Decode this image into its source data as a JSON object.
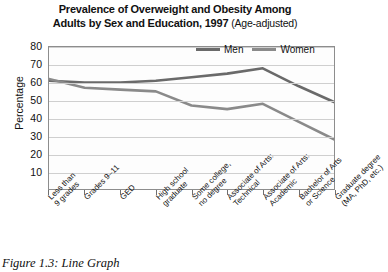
{
  "title": {
    "line1": "Prevalence of Overweight and Obesity Among",
    "line2": "Adults by Sex and Education, 1997",
    "note": "(Age-adjusted)"
  },
  "caption": "Figure 1.3: Line Graph",
  "legend": {
    "position": "top-right",
    "items": [
      {
        "label": "Men",
        "color": "#6a6a6a"
      },
      {
        "label": "Women",
        "color": "#8a8a8a"
      }
    ]
  },
  "axis": {
    "ylabel": "Percentage",
    "yticks": [
      "80",
      "70",
      "60",
      "50",
      "40",
      "30",
      "20",
      "10"
    ]
  },
  "chart_data": {
    "type": "line",
    "title": "Prevalence of Overweight and Obesity Among Adults by Sex and Education, 1997 (Age-adjusted)",
    "xlabel": "",
    "ylabel": "Percentage",
    "ylim": [
      0,
      80
    ],
    "ytick_step": 10,
    "grid": true,
    "legend_position": "top-right",
    "categories": [
      "Less than 9 grades",
      "Grades 9–11",
      "GED",
      "High school graduate",
      "Some college, no degree",
      "Associate of Arts: Technical",
      "Associate of Arts: Academic",
      "Bachelor of Arts or Science",
      "Graduate degree (MA, PhD, etc.)"
    ],
    "series": [
      {
        "name": "Men",
        "color": "#6a6a6a",
        "values": [
          61,
          60,
          60,
          61,
          63,
          65,
          68,
          58,
          49
        ]
      },
      {
        "name": "Women",
        "color": "#8a8a8a",
        "values": [
          62,
          57,
          56,
          55,
          47,
          45,
          48,
          38,
          28
        ]
      }
    ]
  }
}
